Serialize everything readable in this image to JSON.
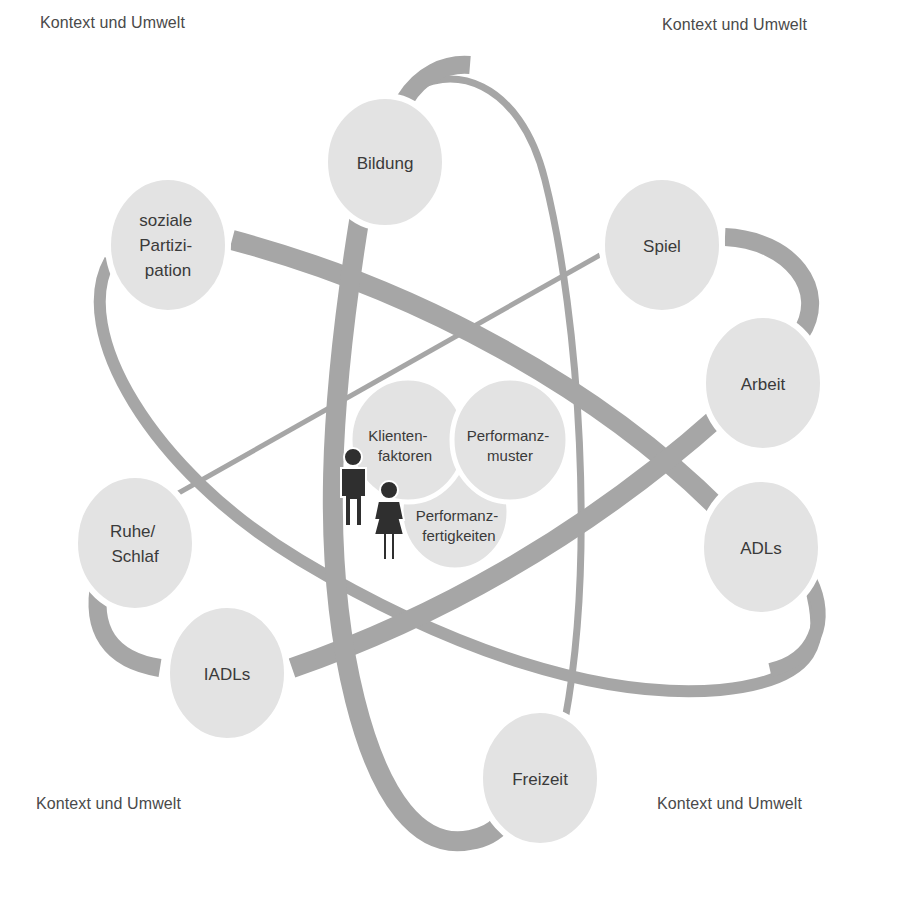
{
  "corners": {
    "top_left": "Kontext und Umwelt",
    "top_right": "Kontext und Umwelt",
    "bottom_left": "Kontext und Umwelt",
    "bottom_right": "Kontext und Umwelt"
  },
  "colors": {
    "orbit": "#a6a6a6",
    "node_fill": "#e3e3e3",
    "node_stroke": "#ffffff",
    "figure": "#2f2f2f",
    "text": "#3a3a3a"
  },
  "nodes": {
    "bildung": {
      "lines": [
        "Bildung"
      ]
    },
    "soziale_partizipation": {
      "lines": [
        "soziale",
        "Partizi-",
        "pation"
      ]
    },
    "spiel": {
      "lines": [
        "Spiel"
      ]
    },
    "arbeit": {
      "lines": [
        "Arbeit"
      ]
    },
    "adls": {
      "lines": [
        "ADLs"
      ]
    },
    "ruhe_schlaf": {
      "lines": [
        "Ruhe/",
        "Schlaf"
      ]
    },
    "iadls": {
      "lines": [
        "IADLs"
      ]
    },
    "freizeit": {
      "lines": [
        "Freizeit"
      ]
    }
  },
  "core": {
    "klientenfaktoren": {
      "lines": [
        "Klienten-",
        "faktoren"
      ]
    },
    "performanzmuster": {
      "lines": [
        "Performanz-",
        "muster"
      ]
    },
    "performanzfertigkeiten": {
      "lines": [
        "Performanz-",
        "fertigkeiten"
      ]
    }
  },
  "figures": {
    "man": "person-male-icon",
    "woman": "person-female-icon"
  }
}
